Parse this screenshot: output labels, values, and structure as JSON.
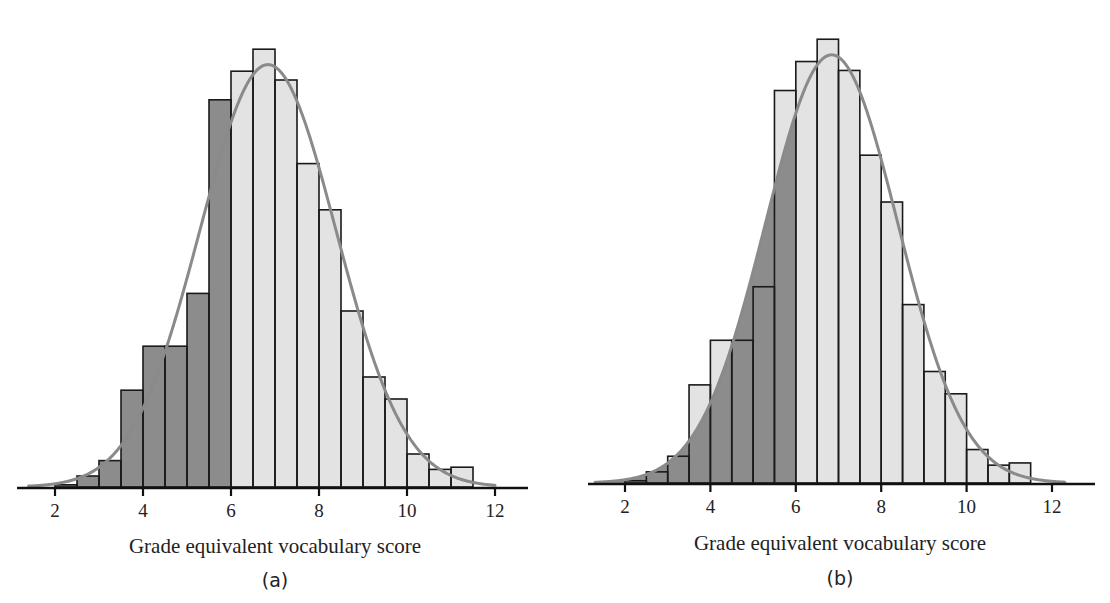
{
  "figure": {
    "panels": [
      {
        "id": "a",
        "label": "(a)",
        "xlabel": "Grade equivalent vocabulary score",
        "shading": "bars-below-6"
      },
      {
        "id": "b",
        "label": "(b)",
        "xlabel": "Grade equivalent vocabulary score",
        "shading": "area-under-curve-below-6"
      }
    ],
    "colors": {
      "dark_fill": "#8c8c8c",
      "light_fill": "#e3e3e3",
      "bar_stroke": "#1a1a1a",
      "curve": "#8a8a8a",
      "axis": "#111111"
    }
  },
  "chart_data": [
    {
      "type": "bar",
      "title": "",
      "panel_label": "(a)",
      "xlabel": "Grade equivalent vocabulary score",
      "ylabel": "",
      "xlim": [
        1.1,
        12.8
      ],
      "xticks": [
        2,
        4,
        6,
        8,
        10,
        12
      ],
      "bin_width": 0.5,
      "bins_start": [
        2.0,
        2.5,
        3.0,
        3.5,
        4.0,
        4.5,
        5.0,
        5.5,
        6.0,
        6.5,
        7.0,
        7.5,
        8.0,
        8.5,
        9.0,
        9.5,
        10.0,
        10.5,
        11.0
      ],
      "values": [
        1,
        5,
        12,
        44,
        64,
        64,
        88,
        176,
        189,
        199,
        185,
        147,
        126,
        80,
        50,
        40,
        15,
        8,
        9
      ],
      "value_units": "relative bar height (proportion of tallest bar ≈ 200)",
      "highlight": "bars with score < 6 shaded dark",
      "overlay": {
        "type": "normal-curve",
        "mean": 6.84,
        "sd": 1.55,
        "peak": 192
      }
    },
    {
      "type": "bar",
      "title": "",
      "panel_label": "(b)",
      "xlabel": "Grade equivalent vocabulary score",
      "ylabel": "",
      "xlim": [
        1.1,
        12.8
      ],
      "xticks": [
        2,
        4,
        6,
        8,
        10,
        12
      ],
      "bin_width": 0.5,
      "bins_start": [
        2.0,
        2.5,
        3.0,
        3.5,
        4.0,
        4.5,
        5.0,
        5.5,
        6.0,
        6.5,
        7.0,
        7.5,
        8.0,
        8.5,
        9.0,
        9.5,
        10.0,
        10.5,
        11.0
      ],
      "values": [
        1,
        5,
        12,
        44,
        64,
        64,
        88,
        176,
        189,
        199,
        185,
        147,
        126,
        80,
        50,
        40,
        15,
        8,
        9
      ],
      "value_units": "relative bar height (proportion of tallest bar ≈ 200)",
      "highlight": "area under normal curve for score < 6 shaded dark",
      "overlay": {
        "type": "normal-curve",
        "mean": 6.84,
        "sd": 1.55,
        "peak": 192
      }
    }
  ],
  "layout": {
    "panels": [
      {
        "axis_x0": 17,
        "axis_x1": 528,
        "x_at_2": 55,
        "px_per_unit": 44,
        "baseline_y": 487,
        "px_per_value": 2.2,
        "curve_from": 1.4,
        "curve_to": 12.0,
        "xlabel_x": 275,
        "xlabel_y": 553,
        "label_x": 275,
        "label_y": 587
      },
      {
        "axis_x0": 588,
        "axis_x1": 1095,
        "x_at_2": 625,
        "px_per_unit": 42.7,
        "baseline_y": 483,
        "px_per_value": 2.23,
        "curve_from": 1.3,
        "curve_to": 12.3,
        "xlabel_x": 840,
        "xlabel_y": 550,
        "label_x": 840,
        "label_y": 585
      }
    ]
  }
}
